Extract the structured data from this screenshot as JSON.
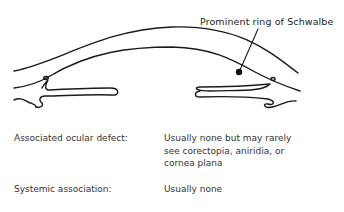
{
  "figure": {
    "callout_label": "Prominent ring of Schwalbe"
  },
  "rows": [
    {
      "label": "Associated ocular defect:",
      "value_lines": [
        "Usually none but may rarely",
        "see corectopia, aniridia, or",
        "cornea plana"
      ]
    },
    {
      "label": "Systemic association:",
      "value_lines": [
        "Usually none"
      ]
    }
  ]
}
